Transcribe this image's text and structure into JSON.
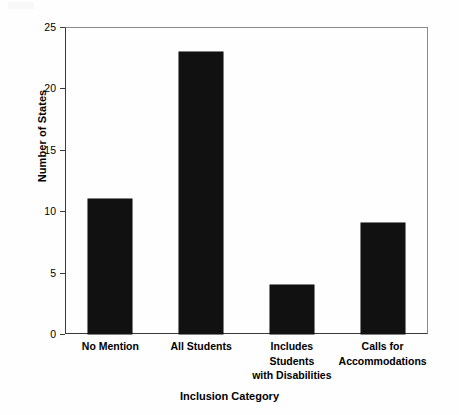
{
  "chart_data": {
    "type": "bar",
    "title": "",
    "xlabel": "Inclusion Category",
    "ylabel": "Number of States",
    "categories": [
      "No Mention",
      "All Students",
      "Includes Students with Disabilities",
      "Calls for Accommodations"
    ],
    "category_lines": [
      [
        "No Mention"
      ],
      [
        "All Students"
      ],
      [
        "Includes",
        "Students",
        "with Disabilities"
      ],
      [
        "Calls for",
        "Accommodations"
      ]
    ],
    "values": [
      11,
      23,
      4,
      9
    ],
    "ylim": [
      0,
      25
    ],
    "yticks": [
      0,
      5,
      10,
      15,
      20,
      25
    ],
    "ytick_labels": [
      "0",
      "5",
      "10",
      "15",
      "20",
      "25"
    ],
    "grid": false,
    "legend": null,
    "bar_color": "#111111",
    "axis_color": "#3a3a3a",
    "background_color": "#fefefe"
  }
}
